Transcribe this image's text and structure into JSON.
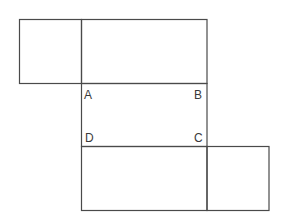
{
  "diagram": {
    "type": "cube-net",
    "stroke_color": "#4a4a4a",
    "labels": {
      "A": "A",
      "B": "B",
      "C": "C",
      "D": "D"
    },
    "faces": [
      {
        "id": "top-left-square",
        "x": 19,
        "y": 19,
        "w": 63,
        "h": 64
      },
      {
        "id": "top-rect",
        "x": 82,
        "y": 19,
        "w": 125,
        "h": 64
      },
      {
        "id": "middle-abcd",
        "x": 82,
        "y": 83,
        "w": 125,
        "h": 63
      },
      {
        "id": "bottom-rect",
        "x": 82,
        "y": 146,
        "w": 125,
        "h": 64
      },
      {
        "id": "bottom-right-square",
        "x": 207,
        "y": 146,
        "w": 62,
        "h": 64
      }
    ]
  }
}
